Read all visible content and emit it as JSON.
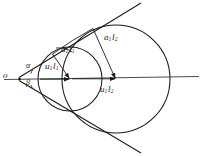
{
  "figure": {
    "background_color": "#ffffff",
    "stroke_color": "#1a1a1a",
    "width": 202,
    "height": 156,
    "labels": {
      "vertex": "o",
      "angle_upper": "α",
      "angle_lower": "β",
      "radius_small_horizontal": {
        "base": "u",
        "sub1": "1",
        "base2": "l",
        "sub2": "1"
      },
      "radius_small_slant": {
        "base": "a",
        "sub1": "1",
        "base2": "l",
        "sub2": "1"
      },
      "radius_large_slant": {
        "base": "a",
        "sub1": "1",
        "base2": "l",
        "sub2": "2"
      },
      "radius_large_horizontal": {
        "base": "u",
        "sub1": "1",
        "base2": "l",
        "sub2": "2"
      }
    },
    "geometry": {
      "axis": {
        "x1": 4,
        "y1": 79,
        "x2": 198,
        "y2": 76
      },
      "vertex": {
        "x": 20,
        "y": 79
      },
      "small_circle": {
        "cx": 70,
        "cy": 79,
        "r": 32
      },
      "large_circle": {
        "cx": 116,
        "cy": 79,
        "r": 54
      },
      "tangent_upper": {
        "x1": 18,
        "y1": 77,
        "x2": 140,
        "y2": 4
      },
      "tangent_lower": {
        "x1": 18,
        "y1": 81,
        "x2": 140,
        "y2": 152
      },
      "small_radius_slant": {
        "x1": 52,
        "y1": 54,
        "x2": 70,
        "y2": 79
      },
      "large_radius_slant": {
        "x1": 92,
        "y1": 29,
        "x2": 116,
        "y2": 79
      },
      "small_radius_horizontal": {
        "x1": 40,
        "y1": 79,
        "x2": 70,
        "y2": 79
      },
      "large_radius_horizontal": {
        "x1": 70,
        "y1": 79,
        "x2": 116,
        "y2": 79
      },
      "small_chord": {
        "x1": 52,
        "y1": 54,
        "x2": 72,
        "y2": 47
      },
      "large_chord": {
        "x1": 92,
        "y1": 29,
        "x2": 66,
        "y2": 44
      }
    }
  }
}
